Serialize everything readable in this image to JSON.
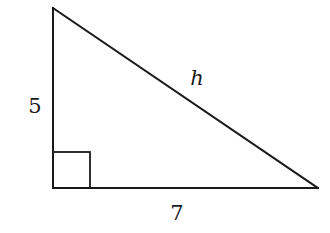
{
  "diagram": {
    "type": "right-triangle",
    "vertices": {
      "top": [
        53,
        8
      ],
      "right_angle": [
        53,
        188
      ],
      "bottom_right": [
        318,
        188
      ]
    },
    "right_angle_marker": {
      "x": 53,
      "y": 152,
      "size": 37
    },
    "labels": {
      "vertical_leg": "5",
      "horizontal_leg": "7",
      "hypotenuse": "h"
    },
    "label_positions": {
      "vertical_leg": [
        35,
        113
      ],
      "horizontal_leg": [
        177,
        220
      ],
      "hypotenuse": [
        197,
        85
      ]
    },
    "colors": {
      "stroke": "#1a1a1a",
      "background": "#ffffff"
    }
  }
}
